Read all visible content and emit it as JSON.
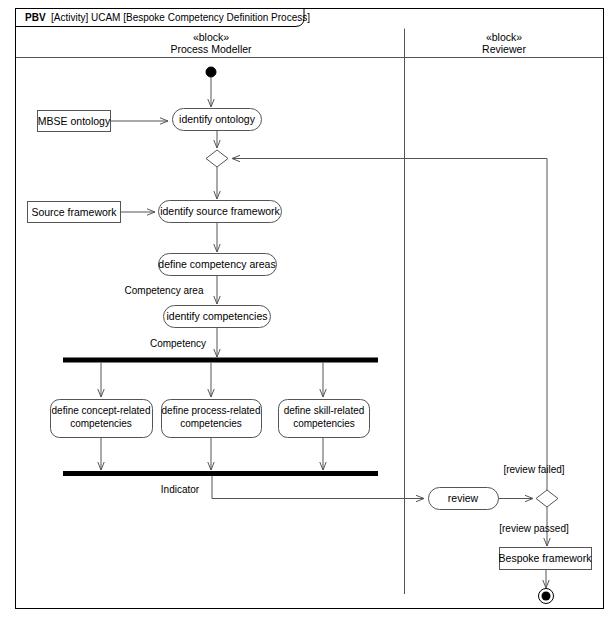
{
  "frame": {
    "header_bold": "PBV",
    "header_rest": " [Activity] UCAM [Bespoke Competency Definition Process]"
  },
  "lanes": [
    {
      "stereotype": "«block»",
      "name": "Process Modeller"
    },
    {
      "stereotype": "«block»",
      "name": "Reviewer"
    }
  ],
  "nodes": {
    "initial": "initial-node",
    "identify_ontology": "identify ontology",
    "mbse_ontology": "MBSE ontology",
    "decision_1": "decision-node",
    "identify_source_framework": "identify source framework",
    "source_framework": "Source framework",
    "define_competency_areas": "define competency areas",
    "identify_competencies": "identify competencies",
    "fork_bar": "fork-node",
    "define_concept_related": "define concept-related competencies",
    "define_process_related": "define process-related competencies",
    "define_skill_related": "define skill-related competencies",
    "join_bar": "join-node",
    "review": "review",
    "decision_2": "decision-node",
    "bespoke_framework": "Bespoke framework",
    "final": "final-node"
  },
  "node_lines": {
    "concept_l1": "define concept-related",
    "concept_l2": "competencies",
    "process_l1": "define process-related",
    "process_l2": "competencies",
    "skill_l1": "define skill-related",
    "skill_l2": "competencies"
  },
  "edge_labels": {
    "competency_area": "Competency area",
    "competency": "Competency",
    "indicator": "Indicator",
    "review_failed": "[review failed]",
    "review_passed": "[review passed]"
  },
  "colors": {
    "stroke": "#000000",
    "line": "#555555",
    "bar": "#000000",
    "background": "#ffffff"
  }
}
